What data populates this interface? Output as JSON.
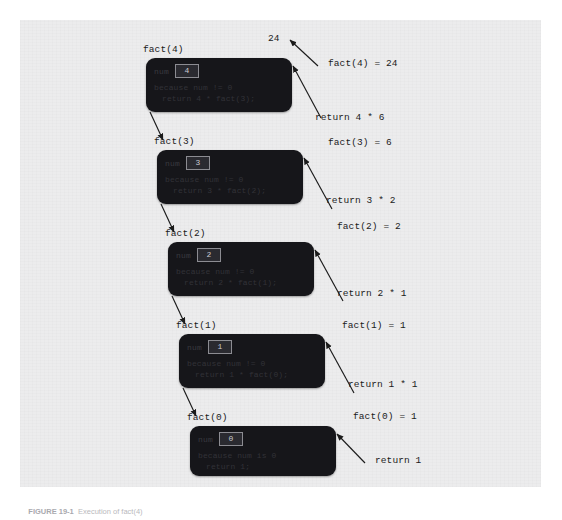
{
  "figure": {
    "caption_id": "FIGURE 19-1",
    "caption_text": "Execution of fact(4)",
    "top_value_label": "24"
  },
  "frames": [
    {
      "call_label": "fact(4)",
      "var_name": "num",
      "var_value": "4",
      "condition_line": "because num != 0",
      "return_line": "return 4 * fact(3);"
    },
    {
      "call_label": "fact(3)",
      "var_name": "num",
      "var_value": "3",
      "condition_line": "because num != 0",
      "return_line": "return 3 * fact(2);"
    },
    {
      "call_label": "fact(2)",
      "var_name": "num",
      "var_value": "2",
      "condition_line": "because num != 0",
      "return_line": "return 2 * fact(1);"
    },
    {
      "call_label": "fact(1)",
      "var_name": "num",
      "var_value": "1",
      "condition_line": "because num != 0",
      "return_line": "return 1 * fact(0);"
    },
    {
      "call_label": "fact(0)",
      "var_name": "num",
      "var_value": "0",
      "condition_line": "because num is 0",
      "return_line": "return 1;"
    }
  ],
  "right_labels": [
    {
      "text": "fact(4) = 24"
    },
    {
      "text": "return 4 * 6"
    },
    {
      "text": "fact(3) = 6"
    },
    {
      "text": "return 3 * 2"
    },
    {
      "text": "fact(2) = 2"
    },
    {
      "text": "return 2 * 1"
    },
    {
      "text": "fact(1) = 1"
    },
    {
      "text": "return 1 * 1"
    },
    {
      "text": "fact(0) = 1"
    },
    {
      "text": "return 1"
    }
  ],
  "colors": {
    "page_background": "#ffffff",
    "panel_background": "#ececed",
    "frame_box": "#16161a",
    "chip_border": "#8c8c92",
    "chip_text": "#c9c9cf",
    "arrow": "#1b1b1b",
    "label_text": "#1b1b1b",
    "caption_text": "#b9b9bd"
  }
}
